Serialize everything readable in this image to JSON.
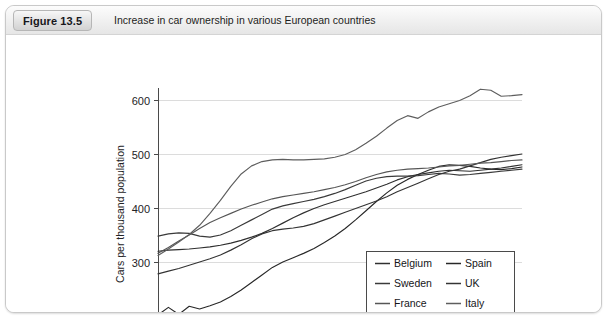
{
  "figure": {
    "badge": "Figure 13.5",
    "caption": "Increase in car ownership in various European countries"
  },
  "chart_data": {
    "type": "line",
    "title": "Increase in car ownership in various European countries",
    "xlabel": "",
    "ylabel": "Cars per thousand population",
    "xlim": [
      1980,
      2015
    ],
    "ylim": [
      200,
      630
    ],
    "grid": true,
    "legend_position": "bottom-right",
    "x_tick_labels": [
      "1980",
      "1985",
      "1990",
      "1995",
      "2000",
      "2005",
      "2010",
      "2015"
    ],
    "x_ticks": [
      1980,
      1985,
      1990,
      1995,
      2000,
      2005,
      2010,
      2015
    ],
    "x_minor_tick_interval": 1,
    "y_tick_labels": [
      "200",
      "300",
      "400",
      "500",
      "600"
    ],
    "y_ticks": [
      200,
      300,
      400,
      500,
      600
    ],
    "x": [
      1980,
      1981,
      1982,
      1983,
      1984,
      1985,
      1986,
      1987,
      1988,
      1989,
      1990,
      1991,
      1992,
      1993,
      1994,
      1995,
      1996,
      1997,
      1998,
      1999,
      2000,
      2001,
      2002,
      2003,
      2004,
      2005,
      2006,
      2007,
      2008,
      2009,
      2010,
      2011,
      2012,
      2013,
      2014,
      2015
    ],
    "series": [
      {
        "name": "Belgium",
        "color": "#303030",
        "values": [
          320,
          322,
          323,
          324,
          326,
          328,
          331,
          335,
          340,
          346,
          353,
          362,
          372,
          382,
          391,
          399,
          406,
          412,
          418,
          424,
          430,
          437,
          444,
          452,
          458,
          462,
          465,
          468,
          470,
          469,
          468,
          470,
          472,
          474,
          477,
          480
        ]
      },
      {
        "name": "Spain",
        "color": "#282828",
        "values": [
          202,
          216,
          203,
          218,
          213,
          219,
          226,
          236,
          248,
          262,
          276,
          290,
          300,
          308,
          316,
          325,
          336,
          348,
          362,
          378,
          395,
          412,
          428,
          442,
          453,
          462,
          470,
          477,
          480,
          479,
          477,
          474,
          472,
          471,
          473,
          476
        ]
      },
      {
        "name": "Sweden",
        "color": "#3a3a3a",
        "values": [
          348,
          352,
          354,
          353,
          348,
          346,
          350,
          358,
          368,
          378,
          388,
          398,
          404,
          408,
          412,
          416,
          421,
          427,
          434,
          442,
          450,
          455,
          458,
          459,
          459,
          460,
          462,
          464,
          463,
          461,
          462,
          464,
          466,
          468,
          470,
          472
        ]
      },
      {
        "name": "UK",
        "color": "#343434",
        "values": [
          278,
          283,
          288,
          294,
          300,
          306,
          313,
          322,
          332,
          343,
          352,
          358,
          361,
          363,
          366,
          371,
          378,
          385,
          392,
          399,
          406,
          413,
          421,
          430,
          438,
          446,
          454,
          462,
          468,
          472,
          478,
          484,
          490,
          494,
          497,
          500
        ]
      },
      {
        "name": "France",
        "color": "#565656",
        "values": [
          316,
          327,
          339,
          350,
          362,
          373,
          382,
          390,
          398,
          405,
          411,
          417,
          421,
          424,
          427,
          430,
          434,
          438,
          443,
          449,
          456,
          462,
          467,
          470,
          472,
          473,
          474,
          476,
          478,
          479,
          481,
          483,
          484,
          486,
          488,
          489
        ]
      },
      {
        "name": "Italy",
        "color": "#5e5e5e",
        "values": [
          312,
          324,
          337,
          351,
          368,
          390,
          414,
          440,
          463,
          478,
          486,
          489,
          490,
          489,
          489,
          490,
          491,
          494,
          499,
          508,
          520,
          533,
          548,
          562,
          571,
          566,
          578,
          587,
          593,
          599,
          608,
          620,
          618,
          607,
          608,
          610
        ]
      }
    ]
  },
  "legend": {
    "items": [
      {
        "label": "Belgium",
        "color": "#303030"
      },
      {
        "label": "Spain",
        "color": "#282828"
      },
      {
        "label": "Sweden",
        "color": "#3a3a3a"
      },
      {
        "label": "UK",
        "color": "#343434"
      },
      {
        "label": "France",
        "color": "#565656"
      },
      {
        "label": "Italy",
        "color": "#5e5e5e"
      }
    ]
  }
}
